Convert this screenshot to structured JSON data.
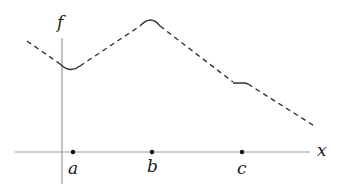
{
  "diagram": {
    "function_label": "f",
    "x_axis_label": "x",
    "points": [
      {
        "label": "a",
        "x": 73
      },
      {
        "label": "b",
        "x": 152
      },
      {
        "label": "c",
        "x": 242
      }
    ],
    "colors": {
      "axis": "#999999",
      "curve": "#333333",
      "point": "#111111"
    }
  }
}
